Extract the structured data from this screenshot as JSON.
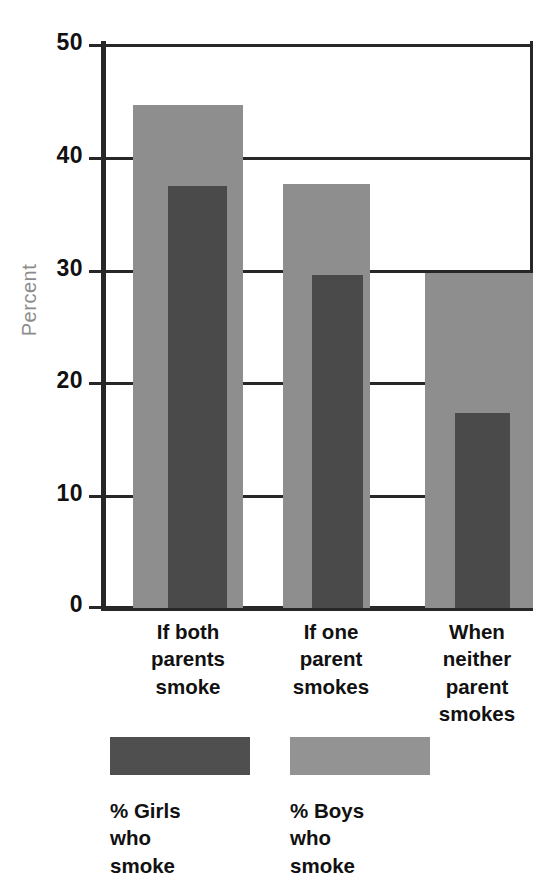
{
  "chart_data": {
    "type": "bar",
    "title": "",
    "xlabel": "",
    "ylabel": "Percent",
    "ylim": [
      0,
      50
    ],
    "yticks": [
      0,
      10,
      20,
      30,
      40,
      50
    ],
    "ytick_labels": [
      "0",
      "10",
      "20",
      "30",
      "40",
      "50"
    ],
    "grid": true,
    "legend_position": "bottom",
    "categories": [
      "If both\nparents\nsmoke",
      "If one\nparent\nsmokes",
      "When\nneither\nparent\nsmokes"
    ],
    "category_labels_flat": [
      "If both parents smoke",
      "If one parent smokes",
      "When neither parent smokes"
    ],
    "series": [
      {
        "name": "% Girls who smoke",
        "legend_label": "% Girls\nwho\nsmoke",
        "color": "#4a4a4a",
        "values": [
          37.4,
          29.5,
          17.3
        ]
      },
      {
        "name": "% Boys who smoke",
        "legend_label": "% Boys\nwho\nsmoke",
        "color": "#8e8e8e",
        "values": [
          44.6,
          37.6,
          29.7
        ]
      }
    ]
  },
  "axis": {
    "y_title": "Percent",
    "y_tick_0": "0",
    "y_tick_1": "10",
    "y_tick_2": "20",
    "y_tick_3": "30",
    "y_tick_4": "40",
    "y_tick_5": "50"
  },
  "categories": {
    "cat_0": "If both\nparents\nsmoke",
    "cat_1": "If one\nparent\nsmokes",
    "cat_2": "When\nneither\nparent\nsmokes"
  },
  "legend": {
    "girls_label": "% Girls\nwho\nsmoke",
    "boys_label": "% Boys\nwho\nsmoke"
  },
  "colors": {
    "girls": "#4a4a4a",
    "boys": "#8e8e8e",
    "axis": "#272727",
    "y_title": "#8c8c8c"
  }
}
